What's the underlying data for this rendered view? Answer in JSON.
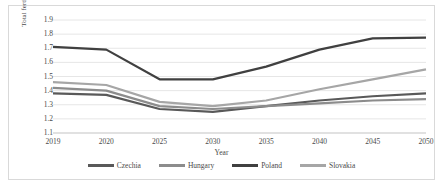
{
  "chart_data": {
    "type": "line",
    "title": "",
    "xlabel": "Year",
    "ylabel": "Total fertility rate",
    "categories": [
      "2019",
      "2020",
      "2025",
      "2030",
      "2035",
      "2040",
      "2045",
      "2050"
    ],
    "x": [
      2019,
      2020,
      2025,
      2030,
      2035,
      2040,
      2045,
      2050
    ],
    "ylim": [
      1.1,
      1.9
    ],
    "yticks": [
      "1.1",
      "1.2",
      "1.3",
      "1.4",
      "1.5",
      "1.6",
      "1.7",
      "1.8",
      "1.9"
    ],
    "ytick_values": [
      1.1,
      1.2,
      1.3,
      1.4,
      1.5,
      1.6,
      1.7,
      1.8,
      1.9
    ],
    "grid": "horizontal",
    "legend_position": "bottom",
    "series": [
      {
        "name": "Czechia",
        "color": "#595959",
        "values": [
          1.38,
          1.37,
          1.27,
          1.25,
          1.29,
          1.33,
          1.36,
          1.38
        ]
      },
      {
        "name": "Hungary",
        "color": "#8c8c8c",
        "values": [
          1.42,
          1.4,
          1.29,
          1.27,
          1.29,
          1.31,
          1.33,
          1.34
        ]
      },
      {
        "name": "Poland",
        "color": "#404040",
        "values": [
          1.71,
          1.69,
          1.48,
          1.48,
          1.57,
          1.69,
          1.77,
          1.775
        ]
      },
      {
        "name": "Slovakia",
        "color": "#a6a6a6",
        "values": [
          1.46,
          1.44,
          1.32,
          1.29,
          1.33,
          1.41,
          1.48,
          1.55
        ]
      }
    ]
  },
  "legend": {
    "items": [
      {
        "label": "Czechia",
        "color": "#595959"
      },
      {
        "label": "Hungary",
        "color": "#8c8c8c"
      },
      {
        "label": "Poland",
        "color": "#404040"
      },
      {
        "label": "Slovakia",
        "color": "#a6a6a6"
      }
    ]
  },
  "axes": {
    "x_title": "Year",
    "y_title": "Total fertility rate"
  },
  "style": {
    "border_color": "#d9d9d9",
    "grid_color": "#e6e6e6",
    "text_color": "#4a4a4a",
    "background": "#ffffff"
  }
}
